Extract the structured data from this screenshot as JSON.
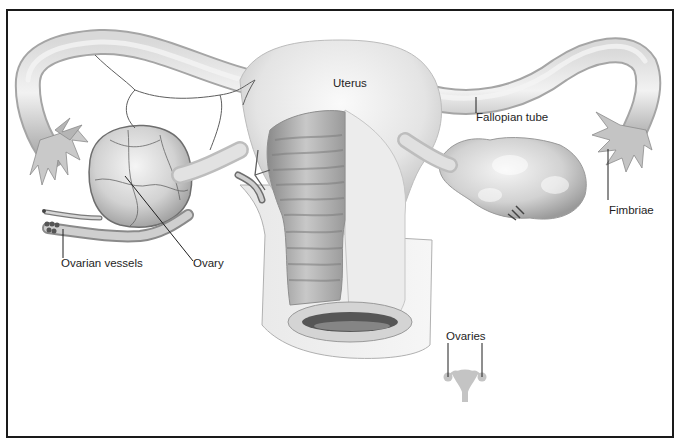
{
  "diagram": {
    "labels": {
      "uterus": "Uterus",
      "fallopian_tube": "Fallopian tube",
      "fimbriae": "Fimbriae",
      "ovarian_vessels": "Ovarian vessels",
      "ovary": "Ovary",
      "ovaries": "Ovaries"
    },
    "colors": {
      "frame": "#1a1a1a",
      "tissue_light": "#e6e6e6",
      "tissue_mid": "#bdbdbd",
      "tissue_dark": "#7a7a7a",
      "leader_line": "#1e1e1e",
      "inset_icon": "#c4c4c4"
    }
  }
}
